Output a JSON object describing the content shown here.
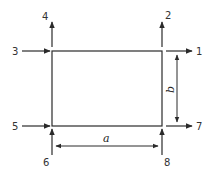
{
  "diagram": {
    "stroke_color": "#2a2a2a",
    "rectangle": {
      "width_label": "a",
      "height_label": "b"
    },
    "nodes": [
      {
        "id": "1",
        "label": "1",
        "corner": "top-right",
        "direction": "right"
      },
      {
        "id": "2",
        "label": "2",
        "corner": "top-right",
        "direction": "up"
      },
      {
        "id": "3",
        "label": "3",
        "corner": "top-left",
        "direction": "right"
      },
      {
        "id": "4",
        "label": "4",
        "corner": "top-left",
        "direction": "up"
      },
      {
        "id": "5",
        "label": "5",
        "corner": "bottom-left",
        "direction": "right"
      },
      {
        "id": "6",
        "label": "6",
        "corner": "bottom-left",
        "direction": "up"
      },
      {
        "id": "7",
        "label": "7",
        "corner": "bottom-right",
        "direction": "right"
      },
      {
        "id": "8",
        "label": "8",
        "corner": "bottom-right",
        "direction": "up"
      }
    ]
  }
}
